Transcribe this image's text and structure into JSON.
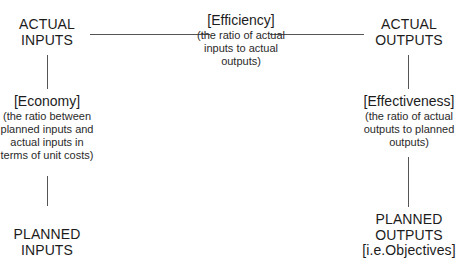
{
  "diagram": {
    "nodes": {
      "actual_inputs": {
        "line1": "ACTUAL",
        "line2": "INPUTS"
      },
      "actual_outputs": {
        "line1": "ACTUAL",
        "line2": "OUTPUTS"
      },
      "planned_inputs": {
        "line1": "PLANNED",
        "line2": "INPUTS"
      },
      "planned_outputs": {
        "line1": "PLANNED",
        "line2": "OUTPUTS",
        "line3": "[i.e.Objectives]"
      }
    },
    "relations": {
      "efficiency": {
        "label": "[Efficiency]",
        "desc_line1": "(the ratio of actual",
        "desc_line2": "inputs to actual",
        "desc_line3": "outputs)",
        "connects": [
          "ACTUAL INPUTS",
          "ACTUAL OUTPUTS"
        ]
      },
      "economy": {
        "label": "[Economy]",
        "desc_line1": "(the ratio between",
        "desc_line2": "planned inputs and",
        "desc_line3": "actual inputs in",
        "desc_line4": "terms of unit costs)",
        "connects": [
          "ACTUAL INPUTS",
          "PLANNED INPUTS"
        ]
      },
      "effectiveness": {
        "label": "[Effectiveness]",
        "desc_line1": "(the ratio of actual",
        "desc_line2": "outputs to planned",
        "desc_line3": "outputs)",
        "connects": [
          "ACTUAL OUTPUTS",
          "PLANNED OUTPUTS"
        ]
      }
    },
    "colors": {
      "text": "#1c1c1c",
      "line": "#555555",
      "background": "#ffffff"
    }
  }
}
